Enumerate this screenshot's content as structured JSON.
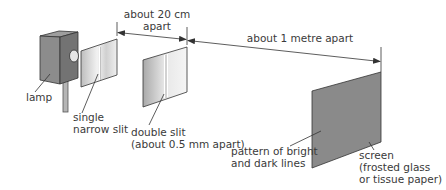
{
  "labels": {
    "lamp": "lamp",
    "single_slit": [
      "single",
      "narrow slit"
    ],
    "distance_1": [
      "about 20 cm",
      "apart"
    ],
    "distance_2": "about 1 metre apart",
    "double_slit": [
      "double slit",
      "(about 0.5 mm apart)"
    ],
    "pattern": [
      "pattern of bright",
      "and dark lines"
    ],
    "screen": [
      "screen",
      "(frosted glass",
      "or tissue paper)"
    ]
  },
  "colors": {
    "lamp_front": "#8c8c8c",
    "lamp_side": "#6f6f6f",
    "lamp_top": "#a8a8a8",
    "slit_panel": "#d9d9d9",
    "screen": "#8a8a8a",
    "line": "#333333",
    "text": "#3a3a3a"
  }
}
